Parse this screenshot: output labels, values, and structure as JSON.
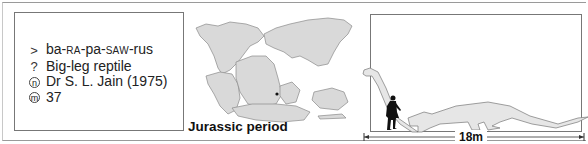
{
  "info": {
    "pronunciation": {
      "icon": "pronunciation-arrow-icon",
      "symbol": ">",
      "parts": [
        "ba-",
        "RA",
        "-pa-",
        "SAW",
        "-rus"
      ]
    },
    "meaning": {
      "icon": "meaning-question-icon",
      "symbol": "?",
      "text": "Big-leg reptile"
    },
    "named_by": {
      "icon": "named-by-n-icon",
      "symbol": "n",
      "text": "Dr S. L. Jain (1975)"
    },
    "mass": {
      "icon": "mass-m-icon",
      "symbol": "m",
      "text": "37"
    }
  },
  "map": {
    "caption": "Jurassic period",
    "land_color": "#d9d9d9",
    "outline_color": "#8a8a8a",
    "location_marker_color": "#111111"
  },
  "size_comparison": {
    "length_label": "18m",
    "dino_fill": "#e6e6e6",
    "human_color": "#111111"
  }
}
